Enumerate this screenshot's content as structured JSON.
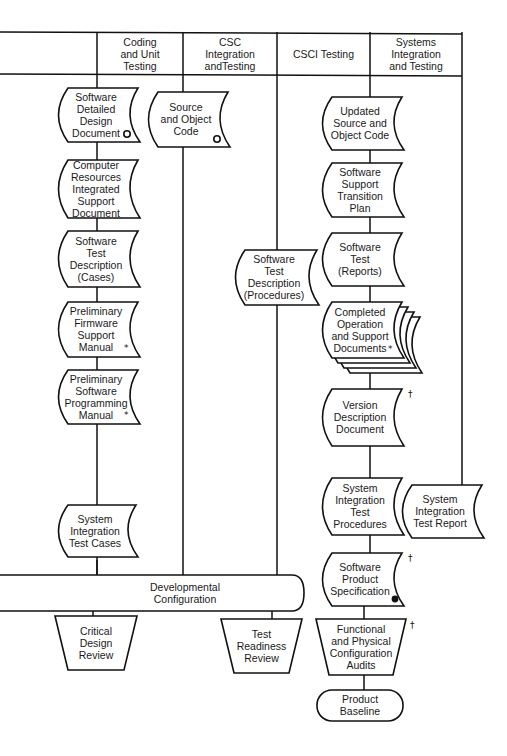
{
  "header": {
    "columns": [
      {
        "id": "coding",
        "label": [
          "Coding",
          "and Unit",
          "Testing"
        ]
      },
      {
        "id": "csc",
        "label": [
          "CSC",
          "Integration",
          "andTesting"
        ]
      },
      {
        "id": "csci",
        "label": [
          "CSCI Testing"
        ]
      },
      {
        "id": "systems",
        "label": [
          "Systems",
          "Integration",
          "and Testing"
        ]
      }
    ]
  },
  "documents": [
    {
      "id": "sddd",
      "lines": [
        "Software",
        "Detailed",
        "Design",
        "Document"
      ],
      "marker": "open-circle"
    },
    {
      "id": "crisd",
      "lines": [
        "Computer",
        "Resources",
        "Integrated",
        "Support",
        "Document"
      ],
      "marker": ""
    },
    {
      "id": "std-cases",
      "lines": [
        "Software",
        "Test",
        "Description",
        "(Cases)"
      ],
      "marker": ""
    },
    {
      "id": "pfsm",
      "lines": [
        "Preliminary",
        "Firmware",
        "Support",
        "Manual"
      ],
      "marker": "asterisk"
    },
    {
      "id": "pspm",
      "lines": [
        "Preliminary",
        "Software",
        "Programming",
        "Manual"
      ],
      "marker": "asterisk"
    },
    {
      "id": "sitc",
      "lines": [
        "System",
        "Integration",
        "Test Cases"
      ],
      "marker": ""
    },
    {
      "id": "soc",
      "lines": [
        "Source",
        "and Object",
        "Code"
      ],
      "marker": "open-circle"
    },
    {
      "id": "std-proc",
      "lines": [
        "Software",
        "Test",
        "Description",
        "(Procedures)"
      ],
      "marker": ""
    },
    {
      "id": "usoc",
      "lines": [
        "Updated",
        "Source and",
        "Object Code"
      ],
      "marker": ""
    },
    {
      "id": "sstp",
      "lines": [
        "Software",
        "Support",
        "Transition",
        "Plan"
      ],
      "marker": ""
    },
    {
      "id": "str",
      "lines": [
        "Software",
        "Test",
        "(Reports)"
      ],
      "marker": ""
    },
    {
      "id": "cosd",
      "lines": [
        "Completed",
        "Operation",
        "and Support",
        "Documents"
      ],
      "marker": "asterisk",
      "stacked": true
    },
    {
      "id": "vdd",
      "lines": [
        "Version",
        "Description",
        "Document"
      ],
      "marker": "dagger"
    },
    {
      "id": "sitp",
      "lines": [
        "System",
        "Integration",
        "Test",
        "Procedures"
      ],
      "marker": ""
    },
    {
      "id": "sps",
      "lines": [
        "Software",
        "Product",
        "Specification"
      ],
      "marker": "dagger",
      "marker2": "filled-circle"
    },
    {
      "id": "sitr",
      "lines": [
        "System",
        "Integration",
        "Test Report"
      ],
      "marker": ""
    }
  ],
  "reviews": [
    {
      "id": "cdr",
      "lines": [
        "Critical",
        "Design",
        "Review"
      ],
      "marker": ""
    },
    {
      "id": "trr",
      "lines": [
        "Test",
        "Readiness",
        "Review"
      ],
      "marker": ""
    },
    {
      "id": "fca-pca",
      "lines": [
        "Functional",
        "and Physical",
        "Configuration",
        "Audits"
      ],
      "marker": "dagger"
    }
  ],
  "baselines": [
    {
      "id": "dev-config",
      "lines": [
        "Developmental",
        "Configuration"
      ]
    },
    {
      "id": "product-baseline",
      "lines": [
        "Product",
        "Baseline"
      ]
    }
  ],
  "markers": {
    "asterisk": "*",
    "dagger": "†"
  }
}
